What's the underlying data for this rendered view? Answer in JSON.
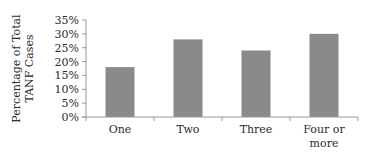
{
  "chart_data": {
    "type": "bar",
    "title": "",
    "xlabel": "",
    "ylabel": "Percentage of Total TANF Cases",
    "ylabel_lines": [
      "Percentage of Total",
      "TANF Cases"
    ],
    "categories": [
      "One",
      "Two",
      "Three",
      "Four or more"
    ],
    "category_lines": [
      [
        "One"
      ],
      [
        "Two"
      ],
      [
        "Three"
      ],
      [
        "Four or",
        "more"
      ]
    ],
    "values": [
      18,
      28,
      24,
      30
    ],
    "value_unit": "%",
    "ylim": [
      0,
      35
    ],
    "yticks": [
      0,
      5,
      10,
      15,
      20,
      25,
      30,
      35
    ],
    "ytick_labels": [
      "0%",
      "5%",
      "10%",
      "15%",
      "20%",
      "25%",
      "30%",
      "35%"
    ],
    "grid": false,
    "legend": "none",
    "bar_color": "#8a8a8a"
  }
}
